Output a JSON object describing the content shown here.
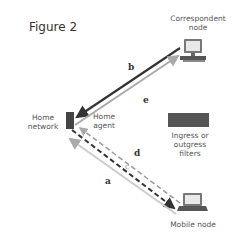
{
  "figure": {
    "title": "Figure 2"
  },
  "nodes": {
    "correspondent": {
      "label_line1": "Correspondent",
      "label_line2": "node"
    },
    "home_network": {
      "label_line1": "Home",
      "label_line2": "network"
    },
    "home_agent": {
      "label_line1": "Home",
      "label_line2": "agent"
    },
    "mobile": {
      "label": "Mobile node"
    }
  },
  "legend": {
    "label_line1": "Ingress or",
    "label_line2": "outgress filters",
    "color": "#555555"
  },
  "paths": {
    "a": "a",
    "b": "b",
    "c": "c",
    "d": "d",
    "e": "e"
  },
  "colors": {
    "dark_line": "#333333",
    "light_line": "#bbbbbb",
    "router": "#444444"
  }
}
